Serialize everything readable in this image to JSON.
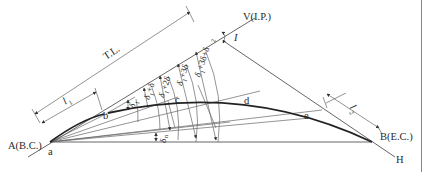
{
  "diagram": {
    "points": {
      "vertex": "V(I.P.)",
      "start": "A(B.C.)",
      "end": "B(E.C.)",
      "start_small": "a",
      "b": "b",
      "c": "c",
      "d": "d",
      "e": "e",
      "h": "H"
    },
    "labels": {
      "tangent_length": "T.L.",
      "intersection_angle": "I",
      "first_chord": "l",
      "first_chord_sub": "1",
      "last_chord": "l",
      "last_chord_sub": "2",
      "delta_n": "δ",
      "delta_n_sub": "n"
    },
    "deflection_angles": [
      {
        "base": "δ",
        "sub": "1",
        "suffix": ""
      },
      {
        "base": "δ",
        "sub": "1",
        "suffix": "+δ"
      },
      {
        "base": "δ",
        "sub": "1",
        "suffix": "+2δ"
      },
      {
        "base": "δ",
        "sub": "1",
        "suffix": "+3δ"
      },
      {
        "base": "δ",
        "sub": "1",
        "suffix": "+3δ+δ",
        "tail_sub": "2"
      }
    ],
    "colors": {
      "line": "#555555",
      "curve": "#222222",
      "text": "#2a2a2a",
      "background": "#ffffff"
    }
  }
}
